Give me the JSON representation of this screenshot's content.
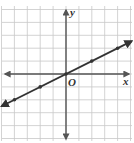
{
  "chart_data": {
    "type": "line",
    "title": "",
    "xlabel": "x",
    "ylabel": "y",
    "origin_label": "O",
    "grid": true,
    "xlim": [
      -5,
      5
    ],
    "ylim": [
      -5,
      5
    ],
    "series": [
      {
        "name": "y = 0.5x",
        "equation": "y = 1/2 x",
        "slope": 0.5,
        "intercept": 0,
        "points": [
          [
            -4,
            -2
          ],
          [
            -2,
            -1
          ],
          [
            0,
            0
          ],
          [
            2,
            1
          ],
          [
            4,
            2
          ]
        ],
        "arrows": "both"
      }
    ]
  },
  "colors": {
    "grid": "#c8c8c8",
    "axis": "#555555",
    "line": "#333333",
    "label": "#333333"
  }
}
